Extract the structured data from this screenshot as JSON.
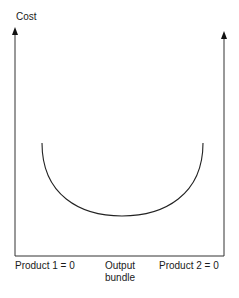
{
  "diagram": {
    "y_axis_label": "Cost",
    "x_labels": {
      "left": "Product 1 = 0",
      "middle_line1": "Output",
      "middle_line2": "bundle",
      "right": "Product 2 = 0"
    },
    "curve": "U-shaped cost curve across output bundles (economies of scope)",
    "colors": {
      "line": "#222222",
      "background": "#ffffff"
    }
  }
}
